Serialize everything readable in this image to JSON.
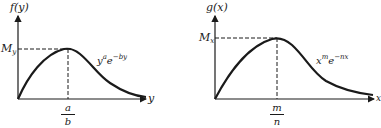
{
  "figures": [
    {
      "id": "left",
      "y_axis_label": "f(y)",
      "x_axis_label": "y",
      "max_label_base": "M",
      "max_label_sub": "y",
      "peak_num": "a",
      "peak_den": "b",
      "curve_label": {
        "base1": "y",
        "exp1": "a",
        "base2": "e",
        "exp2": "−by"
      }
    },
    {
      "id": "right",
      "y_axis_label": "g(x)",
      "x_axis_label": "x",
      "max_label_base": "M",
      "max_label_sub": "x",
      "peak_num": "m",
      "peak_den": "n",
      "curve_label": {
        "base1": "x",
        "exp1": "m",
        "base2": "e",
        "exp2": "−nx"
      }
    }
  ],
  "colors": {
    "ink": "#1a1a1a"
  }
}
